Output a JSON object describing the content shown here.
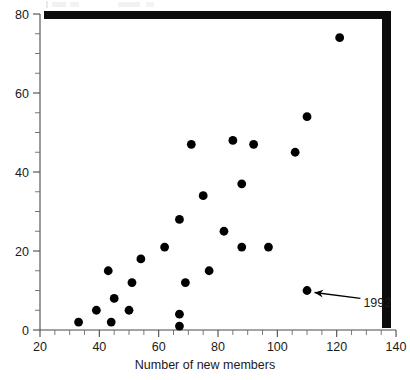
{
  "chart_data": {
    "type": "scatter",
    "title": "",
    "xlabel": "Number of new members",
    "ylabel": "",
    "xlim": [
      20,
      140
    ],
    "ylim": [
      0,
      80
    ],
    "grid": false,
    "legend": null,
    "x_ticks": [
      20,
      40,
      60,
      80,
      100,
      120,
      140
    ],
    "x_tick_labels": [
      "20",
      "40",
      "60",
      "80",
      "100",
      "120",
      "140"
    ],
    "x_minor_step": 5,
    "y_ticks": [
      0,
      20,
      40,
      60,
      80
    ],
    "y_tick_labels": [
      "0",
      "20",
      "40",
      "60",
      "80"
    ],
    "y_minor_step": 5,
    "points": [
      {
        "x": 33,
        "y": 2
      },
      {
        "x": 39,
        "y": 5
      },
      {
        "x": 43,
        "y": 15
      },
      {
        "x": 44,
        "y": 2
      },
      {
        "x": 45,
        "y": 8
      },
      {
        "x": 50,
        "y": 5
      },
      {
        "x": 51,
        "y": 12
      },
      {
        "x": 54,
        "y": 18
      },
      {
        "x": 62,
        "y": 21
      },
      {
        "x": 67,
        "y": 4
      },
      {
        "x": 67,
        "y": 1
      },
      {
        "x": 67,
        "y": 28
      },
      {
        "x": 69,
        "y": 12
      },
      {
        "x": 71,
        "y": 47
      },
      {
        "x": 75,
        "y": 34
      },
      {
        "x": 77,
        "y": 15
      },
      {
        "x": 82,
        "y": 25
      },
      {
        "x": 85,
        "y": 48
      },
      {
        "x": 88,
        "y": 21
      },
      {
        "x": 88,
        "y": 37
      },
      {
        "x": 92,
        "y": 47
      },
      {
        "x": 97,
        "y": 21
      },
      {
        "x": 106,
        "y": 45
      },
      {
        "x": 110,
        "y": 54
      },
      {
        "x": 110,
        "y": 10
      },
      {
        "x": 121,
        "y": 74
      }
    ],
    "annotations": [
      {
        "label": "1992",
        "point_x": 110,
        "point_y": 10,
        "label_x": 129,
        "label_y": 7
      }
    ],
    "marker": {
      "shape": "circle",
      "size_px": 4.4,
      "color": "#000000"
    }
  },
  "colors": {
    "marker": "#000000",
    "axis": "#4a4a4a",
    "text": "#1a1a1a",
    "background": "#ffffff",
    "scan_artifact": "#0c0c0c"
  }
}
